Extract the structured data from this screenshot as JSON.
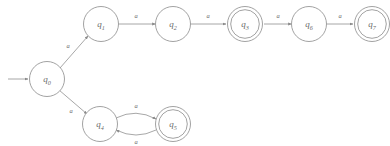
{
  "diagram": {
    "kind": "finite-automaton-state-diagram",
    "alphabet_symbol": "a",
    "background_color": "#ffffff",
    "stroke_color": "#8a8a8a",
    "text_color": "#6b6b6b",
    "start_state": "q0",
    "states": [
      {
        "id": "q0",
        "base": "q",
        "sub": "0",
        "cx": 47,
        "cy": 79,
        "r": 17.5,
        "accepting": false
      },
      {
        "id": "q1",
        "base": "q",
        "sub": "1",
        "cx": 101,
        "cy": 24,
        "r": 17.5,
        "accepting": false
      },
      {
        "id": "q2",
        "base": "q",
        "sub": "2",
        "cx": 173,
        "cy": 24,
        "r": 17.5,
        "accepting": false
      },
      {
        "id": "q3",
        "base": "q",
        "sub": "3",
        "cx": 245,
        "cy": 24,
        "r": 17.5,
        "accepting": true
      },
      {
        "id": "q6",
        "base": "q",
        "sub": "6",
        "cx": 309,
        "cy": 24,
        "r": 17.5,
        "accepting": false
      },
      {
        "id": "q7",
        "base": "q",
        "sub": "7",
        "cx": 372,
        "cy": 24,
        "r": 17.5,
        "accepting": true
      },
      {
        "id": "q4",
        "base": "q",
        "sub": "4",
        "cx": 100,
        "cy": 124,
        "r": 17.5,
        "accepting": false
      },
      {
        "id": "q5",
        "base": "q",
        "sub": "5",
        "cx": 173,
        "cy": 124,
        "r": 17.5,
        "accepting": true
      }
    ],
    "transitions": [
      {
        "id": "t-q0-q1",
        "from": "q0",
        "to": "q1",
        "label": "a",
        "shape": "line",
        "x1": 60,
        "y1": 68,
        "x2": 88,
        "y2": 36,
        "lx": 68,
        "ly": 45
      },
      {
        "id": "t-q1-q2",
        "from": "q1",
        "to": "q2",
        "label": "a",
        "shape": "line",
        "x1": 118.5,
        "y1": 24,
        "x2": 155.5,
        "y2": 24,
        "lx": 136,
        "ly": 15
      },
      {
        "id": "t-q2-q3",
        "from": "q2",
        "to": "q3",
        "label": "a",
        "shape": "line",
        "x1": 190.5,
        "y1": 24,
        "x2": 226,
        "y2": 24,
        "lx": 208,
        "ly": 15
      },
      {
        "id": "t-q3-q6",
        "from": "q3",
        "to": "q6",
        "label": "a",
        "shape": "line",
        "x1": 264,
        "y1": 24,
        "x2": 291.5,
        "y2": 24,
        "lx": 278,
        "ly": 15
      },
      {
        "id": "t-q6-q7",
        "from": "q6",
        "to": "q7",
        "label": "a",
        "shape": "line",
        "x1": 326.5,
        "y1": 24,
        "x2": 353,
        "y2": 24,
        "lx": 340,
        "ly": 15
      },
      {
        "id": "t-q0-q4",
        "from": "q0",
        "to": "q4",
        "label": "a",
        "shape": "line",
        "x1": 59,
        "y1": 90,
        "x2": 87,
        "y2": 114,
        "lx": 71,
        "ly": 110
      },
      {
        "id": "t-q4-q5",
        "from": "q4",
        "to": "q5",
        "label": "a",
        "shape": "arc-upper",
        "path": "M 116,118 Q 136,108 156,119",
        "lx": 136,
        "ly": 105
      },
      {
        "id": "t-q5-q4",
        "from": "q5",
        "to": "q4",
        "label": "a",
        "shape": "arc-lower",
        "path": "M 156,130 Q 136,140 116,130",
        "lx": 136,
        "ly": 141
      }
    ],
    "start_marker": {
      "id": "start-arrow",
      "x1": 8,
      "y1": 79,
      "x2": 28,
      "y2": 79
    }
  }
}
